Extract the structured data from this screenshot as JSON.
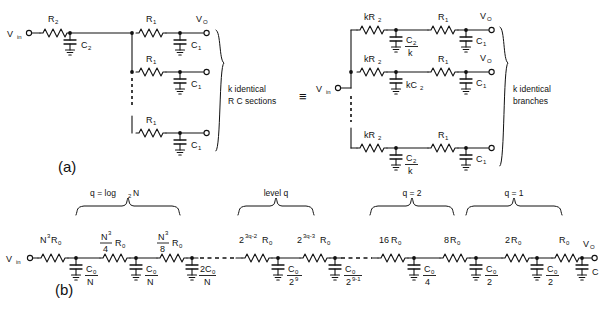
{
  "figure": {
    "panels": [
      {
        "id": "a",
        "label": "(a)"
      },
      {
        "id": "b",
        "label": "(b)"
      }
    ],
    "equivalence_symbol": "≡"
  },
  "panel_a": {
    "label": "(a)",
    "left_circuit": {
      "input_label": "V",
      "input_sub": "in",
      "series_resistor": "R",
      "series_resistor_sub": "2",
      "shunt_cap": "C",
      "shunt_cap_sub": "2",
      "branches": [
        {
          "resistor": "R",
          "resistor_sub": "1",
          "cap": "C",
          "cap_sub": "1",
          "output": "V",
          "output_sub": "O"
        },
        {
          "resistor": "R",
          "resistor_sub": "1",
          "cap": "C",
          "cap_sub": "1",
          "output": "",
          "output_sub": ""
        },
        {
          "resistor": "R",
          "resistor_sub": "1",
          "cap": "C",
          "cap_sub": "1",
          "output": "",
          "output_sub": ""
        }
      ],
      "brace_line1": "k  identical",
      "brace_line2": "R   C   sections"
    },
    "right_circuit": {
      "input_label": "V",
      "input_sub": "in",
      "branches": [
        {
          "resistor": "kR",
          "resistor_sub": "2",
          "cap_num": "C",
          "cap_num_sub": "2",
          "cap_den": "k",
          "cap2": "C",
          "cap2_sub": "1",
          "resistor2": "R",
          "resistor2_sub": "1",
          "output": "V",
          "output_sub": "O"
        },
        {
          "resistor": "kR",
          "resistor_sub": "2",
          "cap_num": "kC",
          "cap_num_sub": "2",
          "cap_den": "",
          "cap2": "C",
          "cap2_sub": "1",
          "resistor2": "R",
          "resistor2_sub": "1",
          "output": "V",
          "output_sub": "O"
        },
        {
          "resistor": "kR",
          "resistor_sub": "2",
          "cap_num": "C",
          "cap_num_sub": "2",
          "cap_den": "k",
          "cap2": "C",
          "cap2_sub": "1",
          "resistor2": "R",
          "resistor2_sub": "1",
          "output": "",
          "output_sub": ""
        }
      ],
      "brace_line1": "k  identical",
      "brace_line2": "branches"
    }
  },
  "panel_b": {
    "label": "(b)",
    "input_label": "V",
    "input_sub": "in",
    "output_label": "V",
    "output_sub": "O",
    "group_braces": [
      {
        "label": "q = log",
        "label_sub": "2",
        "label_tail": " N"
      },
      {
        "label": "level  q",
        "label_sub": "",
        "label_tail": ""
      },
      {
        "label": "q = 2",
        "label_sub": "",
        "label_tail": ""
      },
      {
        "label": "q = 1",
        "label_sub": "",
        "label_tail": ""
      }
    ],
    "resistors": [
      {
        "base": "N",
        "sup": "3",
        "tail": "R",
        "tail_sub": "0"
      },
      {
        "frac_num": "N",
        "frac_num_sup": "3",
        "frac_den": "4",
        "tail": "R",
        "tail_sub": "0"
      },
      {
        "frac_num": "N",
        "frac_num_sup": "3",
        "frac_den": "8",
        "tail": "R",
        "tail_sub": "0"
      },
      {
        "base": "2",
        "sup": "3q-2",
        "tail": "R",
        "tail_sub": "0"
      },
      {
        "base": "2",
        "sup": "3q-3",
        "tail": "R",
        "tail_sub": "0"
      },
      {
        "base": "16",
        "sup": "",
        "tail": "R",
        "tail_sub": "0"
      },
      {
        "base": "8",
        "sup": "",
        "tail": "R",
        "tail_sub": "0"
      },
      {
        "base": "2",
        "sup": "",
        "tail": "R",
        "tail_sub": "0"
      },
      {
        "base": "",
        "sup": "",
        "tail": "R",
        "tail_sub": "0"
      }
    ],
    "capacitors": [
      {
        "num": "C",
        "num_sub": "0",
        "den": "N",
        "den_sup": ""
      },
      {
        "num": "C",
        "num_sub": "0",
        "den": "N",
        "den_sup": ""
      },
      {
        "num": "2C",
        "num_sub": "0",
        "den": "N",
        "den_sup": ""
      },
      {
        "num": "C",
        "num_sub": "0",
        "den": "2",
        "den_sup": "9"
      },
      {
        "num": "C",
        "num_sub": "0",
        "den": "2",
        "den_sup": "9-1"
      },
      {
        "num": "C",
        "num_sub": "0",
        "den": "4",
        "den_sup": ""
      },
      {
        "num": "C",
        "num_sub": "0",
        "den": "2",
        "den_sup": ""
      },
      {
        "num": "C",
        "num_sub": "0",
        "den": "2",
        "den_sup": ""
      },
      {
        "num": "C",
        "num_sub": "",
        "den": "",
        "den_sup": ""
      }
    ]
  },
  "colors": {
    "ink": "#111111",
    "background": "#ffffff"
  }
}
